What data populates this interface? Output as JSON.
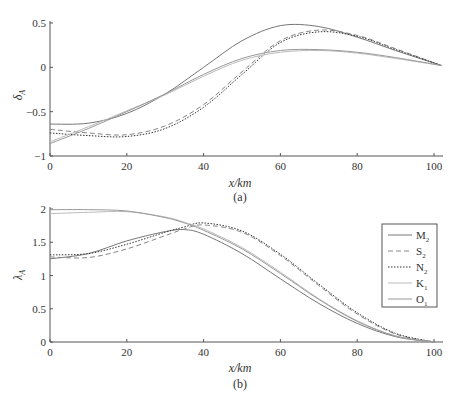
{
  "chart_data": [
    {
      "type": "line",
      "panel": "(a)",
      "xlabel": "x/km",
      "ylabel": "δA",
      "xlim": [
        0,
        102
      ],
      "ylim": [
        -1,
        0.5
      ],
      "xticks": [
        0,
        20,
        40,
        60,
        80,
        100
      ],
      "yticks": [
        0.5,
        0,
        -0.5,
        -1
      ],
      "ytick_labels": [
        "0.5",
        "0",
        "−0.5",
        "−1"
      ],
      "x": [
        0,
        10,
        20,
        30,
        40,
        50,
        60,
        70,
        80,
        90,
        102
      ],
      "series": [
        {
          "name": "M2",
          "style": "solid",
          "color": "#777777",
          "values": [
            -0.64,
            -0.63,
            -0.52,
            -0.3,
            0.0,
            0.3,
            0.47,
            0.46,
            0.34,
            0.19,
            0.02
          ]
        },
        {
          "name": "S2",
          "style": "dashed",
          "color": "#888888",
          "values": [
            -0.7,
            -0.74,
            -0.76,
            -0.66,
            -0.42,
            -0.05,
            0.3,
            0.42,
            0.36,
            0.21,
            0.02
          ]
        },
        {
          "name": "N2",
          "style": "dotted",
          "color": "#333333",
          "values": [
            -0.74,
            -0.77,
            -0.78,
            -0.69,
            -0.45,
            -0.08,
            0.28,
            0.4,
            0.35,
            0.2,
            0.02
          ]
        },
        {
          "name": "K1",
          "style": "solid",
          "color": "#bbbbbb",
          "values": [
            -0.84,
            -0.67,
            -0.49,
            -0.31,
            -0.1,
            0.08,
            0.17,
            0.19,
            0.16,
            0.1,
            0.02
          ]
        },
        {
          "name": "O1",
          "style": "solid",
          "color": "#999999",
          "values": [
            -0.86,
            -0.69,
            -0.5,
            -0.3,
            -0.08,
            0.1,
            0.19,
            0.2,
            0.17,
            0.11,
            0.02
          ]
        }
      ]
    },
    {
      "type": "line",
      "panel": "(b)",
      "xlabel": "x/km",
      "ylabel": "λA",
      "xlim": [
        0,
        102
      ],
      "ylim": [
        0,
        2
      ],
      "xticks": [
        0,
        20,
        40,
        60,
        80,
        100
      ],
      "yticks": [
        2,
        1.5,
        1,
        0.5,
        0
      ],
      "ytick_labels": [
        "2",
        "1.5",
        "1",
        "0.5",
        "0"
      ],
      "x": [
        0,
        10,
        20,
        30,
        35,
        40,
        50,
        60,
        70,
        80,
        90,
        100
      ],
      "series": [
        {
          "name": "M2",
          "style": "solid",
          "color": "#777777",
          "values": [
            1.25,
            1.33,
            1.52,
            1.66,
            1.69,
            1.62,
            1.33,
            0.95,
            0.58,
            0.28,
            0.08,
            0.0
          ]
        },
        {
          "name": "S2",
          "style": "dashed",
          "color": "#888888",
          "values": [
            1.28,
            1.27,
            1.4,
            1.6,
            1.7,
            1.76,
            1.65,
            1.3,
            0.85,
            0.42,
            0.12,
            0.0
          ]
        },
        {
          "name": "N2",
          "style": "dotted",
          "color": "#333333",
          "values": [
            1.31,
            1.33,
            1.47,
            1.65,
            1.73,
            1.79,
            1.67,
            1.32,
            0.87,
            0.44,
            0.13,
            0.0
          ]
        },
        {
          "name": "K1",
          "style": "solid",
          "color": "#bbbbbb",
          "values": [
            1.93,
            1.95,
            1.96,
            1.88,
            1.8,
            1.7,
            1.42,
            1.05,
            0.65,
            0.32,
            0.09,
            0.0
          ]
        },
        {
          "name": "O1",
          "style": "solid",
          "color": "#999999",
          "values": [
            1.99,
            1.99,
            1.97,
            1.87,
            1.79,
            1.68,
            1.4,
            1.03,
            0.64,
            0.31,
            0.09,
            0.0
          ]
        }
      ]
    }
  ],
  "panels": [
    {
      "label": "(a)",
      "xlabel": "x/km",
      "ylabel": "δ",
      "ylabel_sub": "A"
    },
    {
      "label": "(b)",
      "xlabel": "x/km",
      "ylabel": "λ",
      "ylabel_sub": "A"
    }
  ],
  "legend": [
    {
      "name": "M",
      "sub": "2"
    },
    {
      "name": "S",
      "sub": "2"
    },
    {
      "name": "N",
      "sub": "2"
    },
    {
      "name": "K",
      "sub": "1"
    },
    {
      "name": "O",
      "sub": "1"
    }
  ]
}
